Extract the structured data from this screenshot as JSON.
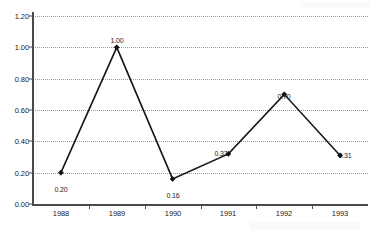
{
  "chart_data": {
    "type": "line",
    "title": "",
    "subtitle": "",
    "xlabel": "",
    "ylabel": "",
    "categories": [
      "1988",
      "1989",
      "1990",
      "1991",
      "1992",
      "1993"
    ],
    "values": [
      0.2,
      1.0,
      0.16,
      0.32,
      0.7,
      0.31
    ],
    "point_labels": [
      "0.20",
      "1.00",
      "0.16",
      "0.32",
      "0.70",
      "0.31"
    ],
    "series": [
      {
        "name": "",
        "values": [
          0.2,
          1.0,
          0.16,
          0.32,
          0.7,
          0.31
        ]
      }
    ],
    "ylim": [
      0.0,
      1.2
    ],
    "y_ticks": [
      0.0,
      0.2,
      0.4,
      0.6,
      0.8,
      1.0,
      1.2
    ],
    "y_tick_labels": [
      "0.00",
      "0.20",
      "0.40",
      "0.60",
      "0.80",
      "1.00",
      "1.20"
    ],
    "x_tick_labels": [
      "1988",
      "1989",
      "1990",
      "1991",
      "1992",
      "1993"
    ],
    "grid": true,
    "grid_style": "dotted-horizontal",
    "legend": false,
    "legend_position": "none",
    "marker": "diamond",
    "line_color": "#161616",
    "marker_color": "#111111",
    "grid_color": "#9a9a9a",
    "axis_color": "#4a4a4a",
    "label_color": "#1a1a1a",
    "background_color": "#ffffff",
    "annotations": []
  }
}
